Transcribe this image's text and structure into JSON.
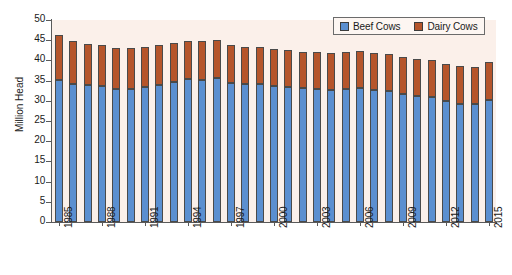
{
  "chart_data": {
    "type": "bar",
    "subtype": "stacked-bar",
    "title": "",
    "xlabel": "",
    "ylabel": "Million Head",
    "ylim": [
      0,
      50
    ],
    "ytick_step": 5,
    "ytick_labels": [
      "50",
      "45",
      "40",
      "35",
      "30",
      "25",
      "20",
      "15",
      "10",
      "5",
      "0"
    ],
    "ytick_values": [
      50,
      45,
      40,
      35,
      30,
      25,
      20,
      15,
      10,
      5,
      0
    ],
    "grid": false,
    "legend_position": "top-right",
    "x_tick_interval": 3,
    "x_label_rotation": -90,
    "categories": [
      "1985",
      "1986",
      "1987",
      "1988",
      "1989",
      "1990",
      "1991",
      "1992",
      "1993",
      "1994",
      "1995",
      "1996",
      "1997",
      "1998",
      "1999",
      "2000",
      "2001",
      "2002",
      "2003",
      "2004",
      "2005",
      "2006",
      "2007",
      "2008",
      "2009",
      "2010",
      "2011",
      "2012",
      "2013",
      "2014",
      "2015"
    ],
    "visible_tick_labels": [
      "1985",
      "1988",
      "1991",
      "1994",
      "1997",
      "2000",
      "2003",
      "2006",
      "2009",
      "2012",
      "2015"
    ],
    "series": [
      {
        "name": "Beef Cows",
        "color": "#5b8fd0",
        "values": [
          35.1,
          34.1,
          33.8,
          33.6,
          33.0,
          32.9,
          33.3,
          33.9,
          34.6,
          35.3,
          35.2,
          35.6,
          34.5,
          34.2,
          34.1,
          33.6,
          33.4,
          33.1,
          32.9,
          32.8,
          33.0,
          33.2,
          32.7,
          32.4,
          31.7,
          31.3,
          30.9,
          30.0,
          29.3,
          29.1,
          30.2
        ]
      },
      {
        "name": "Dairy Cows",
        "color": "#b5552b",
        "values": [
          11.2,
          10.8,
          10.3,
          10.2,
          10.0,
          10.1,
          10.0,
          9.8,
          9.7,
          9.5,
          9.5,
          9.4,
          9.3,
          9.2,
          9.2,
          9.2,
          9.1,
          9.1,
          9.1,
          9.0,
          9.0,
          9.1,
          9.2,
          9.3,
          9.2,
          9.1,
          9.2,
          9.2,
          9.2,
          9.2,
          9.3
        ]
      }
    ],
    "totals": [
      46.3,
      44.9,
      44.1,
      43.8,
      43.0,
      43.0,
      43.3,
      43.7,
      44.3,
      44.8,
      44.7,
      45.0,
      43.8,
      43.4,
      43.3,
      42.8,
      42.5,
      42.2,
      42.0,
      41.8,
      42.0,
      42.3,
      41.9,
      41.7,
      40.9,
      40.4,
      40.1,
      39.2,
      38.5,
      38.3,
      39.5
    ]
  },
  "legend": {
    "entries": [
      {
        "label": "Beef Cows",
        "color": "#5b8fd0"
      },
      {
        "label": "Dairy Cows",
        "color": "#b5552b"
      }
    ]
  },
  "colors": {
    "plot_background": "#fbf0ea",
    "page_background": "#ffffff",
    "axis": "#5a5a5a",
    "beef": "#5b8fd0",
    "dairy": "#b5552b",
    "bar_border": "#4a4a4a",
    "text": "#1a1a1a"
  }
}
